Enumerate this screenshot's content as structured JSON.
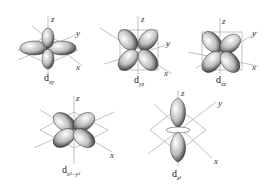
{
  "figure": {
    "orbitals": [
      {
        "name": "d",
        "subscript": "xy",
        "axes": {
          "z": "z",
          "y": "y",
          "x": "x"
        }
      },
      {
        "name": "d",
        "subscript": "yz",
        "axes": {
          "z": "z",
          "y": "y",
          "x": "x"
        }
      },
      {
        "name": "d",
        "subscript": "xz",
        "axes": {
          "z": "z",
          "y": "y",
          "x": "x"
        }
      },
      {
        "name": "d",
        "subscript": "x²−y²",
        "axes": {
          "z": "z",
          "y": "y",
          "x": "x"
        }
      },
      {
        "name": "d",
        "subscript": "z²",
        "axes": {
          "z": "z",
          "y": "y",
          "x": "x"
        }
      }
    ]
  }
}
